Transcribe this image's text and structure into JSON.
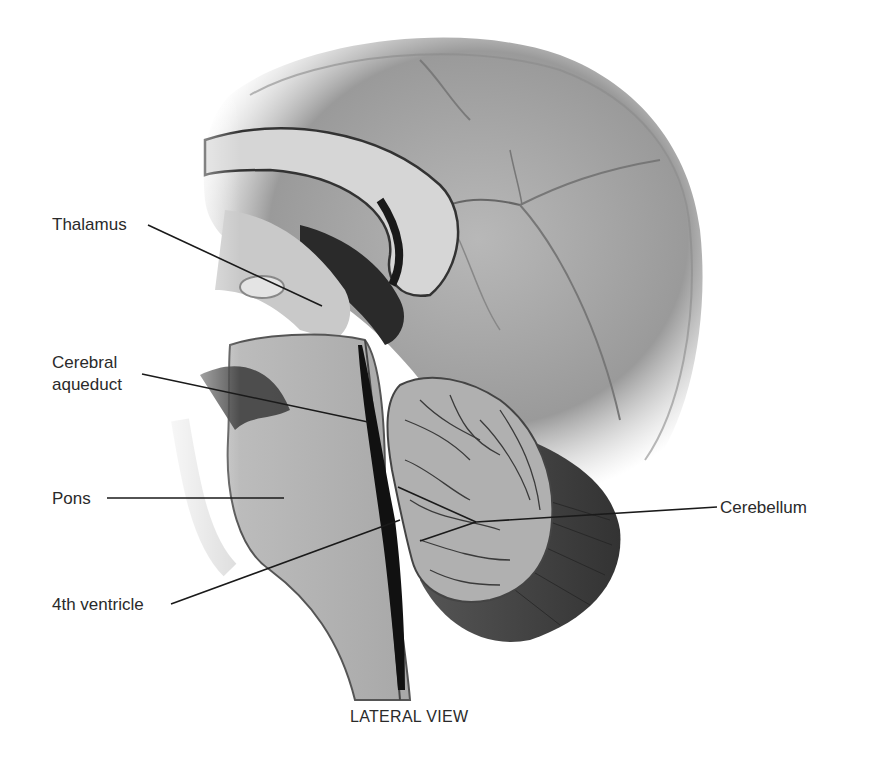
{
  "figure": {
    "caption": "LATERAL VIEW",
    "labels": {
      "thalamus": "Thalamus",
      "cerebral_aqueduct_line1": "Cerebral",
      "cerebral_aqueduct_line2": "aqueduct",
      "pons": "Pons",
      "fourth_ventricle": "4th ventricle",
      "cerebellum": "Cerebellum"
    },
    "colors": {
      "background": "#ffffff",
      "text": "#2a2a2a",
      "leader_line": "#1a1a1a"
    }
  }
}
